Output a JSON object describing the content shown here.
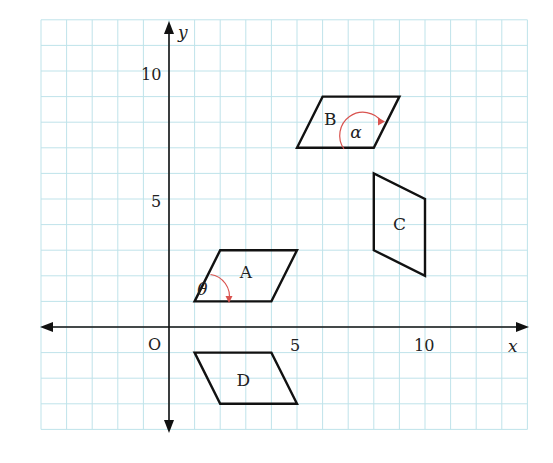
{
  "figure": {
    "type": "coordinate-grid-diagram",
    "origin_label": "O",
    "x_axis": {
      "label": "x",
      "ticks": [
        {
          "value": 5,
          "label": "5"
        },
        {
          "value": 10,
          "label": "10"
        }
      ]
    },
    "y_axis": {
      "label": "y",
      "ticks": [
        {
          "value": 5,
          "label": "5"
        },
        {
          "value": 10,
          "label": "10"
        }
      ]
    },
    "grid": {
      "x_range": [
        -5,
        14
      ],
      "y_range": [
        -4,
        12
      ],
      "step": 1
    },
    "colors": {
      "grid": "#bfe3ea",
      "axes": "#111111",
      "shapes": "#111111",
      "angle_arc": "#d9534f",
      "background": "#ffffff"
    },
    "shapes": [
      {
        "name": "A",
        "label": "A",
        "vertices": [
          [
            1,
            1
          ],
          [
            4,
            1
          ],
          [
            5,
            3
          ],
          [
            2,
            3
          ]
        ],
        "label_pos": [
          3.0,
          1.9
        ]
      },
      {
        "name": "B",
        "label": "B",
        "vertices": [
          [
            5,
            7
          ],
          [
            8,
            7
          ],
          [
            9,
            9
          ],
          [
            6,
            9
          ]
        ],
        "label_pos": [
          6.3,
          7.9
        ]
      },
      {
        "name": "C",
        "label": "C",
        "vertices": [
          [
            8,
            3
          ],
          [
            10,
            2
          ],
          [
            10,
            5
          ],
          [
            8,
            6
          ]
        ],
        "label_pos": [
          9.0,
          3.8
        ]
      },
      {
        "name": "D",
        "label": "D",
        "vertices": [
          [
            1,
            -1
          ],
          [
            4,
            -1
          ],
          [
            5,
            -3
          ],
          [
            2,
            -3
          ]
        ],
        "label_pos": [
          2.9,
          -2.3
        ]
      }
    ],
    "angles": [
      {
        "symbol": "θ",
        "shape": "A",
        "label_pos": [
          1.3,
          1.25
        ]
      },
      {
        "symbol": "α",
        "shape": "B",
        "label_pos": [
          7.3,
          7.4
        ]
      }
    ]
  }
}
